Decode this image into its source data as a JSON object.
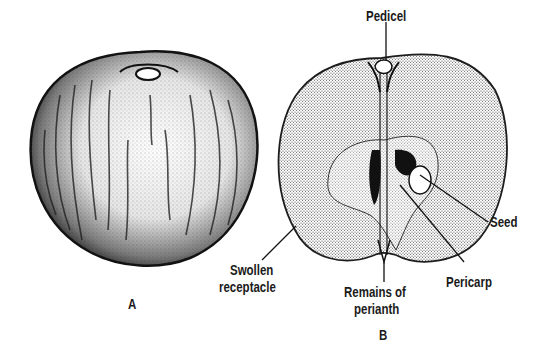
{
  "figure": {
    "panels": [
      {
        "id": "A",
        "label": "A",
        "description": "Whole apple exterior, stippled shading with streaks"
      },
      {
        "id": "B",
        "label": "B",
        "description": "Longitudinal section of apple"
      }
    ],
    "labels": {
      "pedicel": "Pedicel",
      "seed": "Seed",
      "swollen_receptacle_line1": "Swollen",
      "swollen_receptacle_line2": "receptacle",
      "pericarp": "Pericarp",
      "remains_of_perianth_line1": "Remains of",
      "remains_of_perianth_line2": "perianth"
    },
    "colors": {
      "ink": "#1a1a1a",
      "background": "#ffffff"
    }
  }
}
